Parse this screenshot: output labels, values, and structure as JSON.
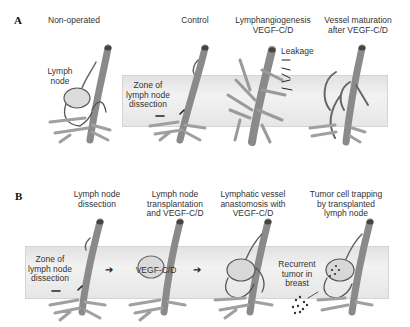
{
  "panels": [
    {
      "letter": "A",
      "steps": [
        {
          "title": "Non-operated",
          "annotations": [
            "Lymph",
            "node"
          ]
        },
        {
          "title": "Control",
          "annotations": [
            "Zone of",
            "lymph node",
            "dissection"
          ]
        },
        {
          "title_lines": [
            "Lymphangiogenesis",
            "VEGF-C/D"
          ],
          "annotations": [
            "Leakage"
          ]
        },
        {
          "title_lines": [
            "Vessel maturation",
            "after VEGF-C/D"
          ]
        }
      ]
    },
    {
      "letter": "B",
      "steps": [
        {
          "title_lines": [
            "Lymph node",
            "dissection"
          ],
          "annotations": [
            "Zone of",
            "lymph node",
            "dissection"
          ]
        },
        {
          "title_lines": [
            "Lymph node",
            "transplantation",
            "and VEGF-C/D"
          ],
          "annotations": [
            "VEGF-C/D"
          ]
        },
        {
          "title_lines": [
            "Lymphatic vessel",
            "anastomosis with",
            "VEGF-C/D"
          ]
        },
        {
          "title_lines": [
            "Tumor cell trapping",
            "by transplanted",
            "lymph node"
          ],
          "annotations": [
            "Recurrent",
            "tumor in",
            "breast"
          ]
        }
      ],
      "flow_arrow": "➔"
    }
  ],
  "colors": {
    "vessel": "#8a8a8a",
    "vessel_dark": "#5a5a5a",
    "node": "#d8d8d8",
    "band": "#ececec",
    "arrow": "#111111"
  }
}
